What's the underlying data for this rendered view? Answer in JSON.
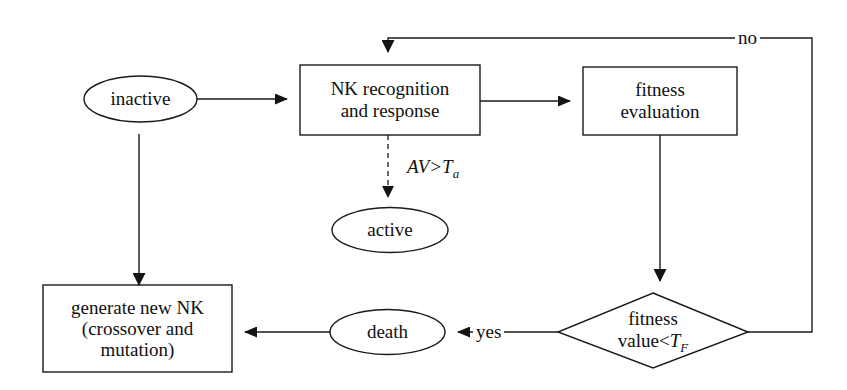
{
  "diagram": {
    "background_color": "#ffffff",
    "stroke_color": "#1a1a1a"
  },
  "nodes": {
    "inactive": {
      "label": "inactive",
      "shape": "ellipse"
    },
    "nk_recognition": {
      "line1": "NK recognition",
      "line2": "and response",
      "shape": "rectangle"
    },
    "fitness_evaluation": {
      "line1": "fitness",
      "line2": "evaluation",
      "shape": "rectangle"
    },
    "active": {
      "label": "active",
      "shape": "ellipse"
    },
    "fitness_decision": {
      "line1": "fitness",
      "line2_prefix": "value<",
      "line2_symbol": "T",
      "line2_subscript": "F",
      "shape": "diamond"
    },
    "death": {
      "label": "death",
      "shape": "ellipse"
    },
    "generate_nk": {
      "line1": "generate new NK",
      "line2": "(crossover and",
      "line3": "mutation)",
      "shape": "rectangle"
    }
  },
  "edge_labels": {
    "no": "no",
    "yes": "yes",
    "threshold_prefix": "AV>",
    "threshold_symbol": "T",
    "threshold_subscript": "a"
  }
}
